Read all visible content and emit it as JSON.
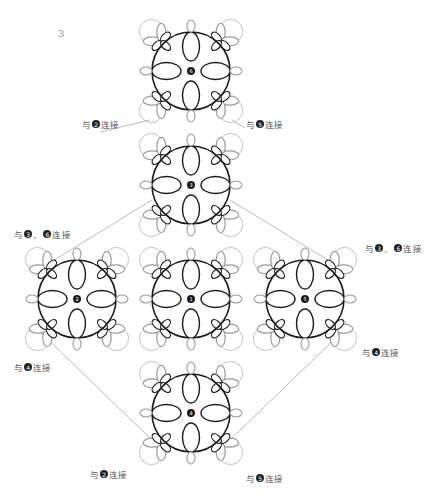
{
  "page_number": "3",
  "motifs": [
    {
      "id": "6",
      "cx": 191,
      "cy": 71
    },
    {
      "id": "3",
      "cx": 191,
      "cy": 185
    },
    {
      "id": "2",
      "cx": 77,
      "cy": 299
    },
    {
      "id": "1",
      "cx": 191,
      "cy": 299
    },
    {
      "id": "5",
      "cx": 305,
      "cy": 299
    },
    {
      "id": "4",
      "cx": 191,
      "cy": 413
    }
  ],
  "labels": [
    {
      "id": "top-left",
      "prefix": "与",
      "nums": [
        "2"
      ],
      "suffix": "连接",
      "x": 82,
      "y": 124
    },
    {
      "id": "top-right",
      "prefix": "与",
      "nums": [
        "5"
      ],
      "suffix": "连接",
      "x": 246,
      "y": 124
    },
    {
      "id": "mid-left",
      "prefix": "与",
      "nums": [
        "3",
        "6"
      ],
      "suffix": "连接",
      "x": 14,
      "y": 234
    },
    {
      "id": "mid-right",
      "prefix": "与",
      "nums": [
        "3",
        "6"
      ],
      "suffix": "连接",
      "x": 365,
      "y": 248
    },
    {
      "id": "low-left",
      "prefix": "与",
      "nums": [
        "4"
      ],
      "suffix": "连接",
      "x": 14,
      "y": 367
    },
    {
      "id": "low-right",
      "prefix": "与",
      "nums": [
        "4"
      ],
      "suffix": "连接",
      "x": 362,
      "y": 352
    },
    {
      "id": "bottom-left",
      "prefix": "与",
      "nums": [
        "2"
      ],
      "suffix": "连接",
      "x": 90,
      "y": 474
    },
    {
      "id": "bottom-right",
      "prefix": "与",
      "nums": [
        "5"
      ],
      "suffix": "连接",
      "x": 246,
      "y": 478
    }
  ],
  "colors": {
    "ring": "#1a1a1a",
    "outer": "#9a9a9a",
    "line": "#aaaaaa"
  }
}
